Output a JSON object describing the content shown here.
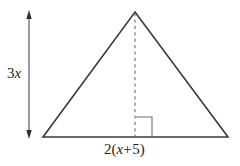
{
  "figure": {
    "name": "isosceles-triangle-with-height-and-base-labels",
    "background_color": "#ffffff",
    "stroke_color": "#3a3a3a",
    "text_color": "#231f20",
    "shape": {
      "type": "triangle",
      "apex": [
        135,
        12
      ],
      "left_vertex": [
        43,
        137
      ],
      "right_vertex": [
        228,
        137
      ]
    },
    "altitude": {
      "style": "dashed",
      "from": [
        135,
        12
      ],
      "to": [
        135,
        137
      ],
      "right_angle_marker": true
    },
    "height_dimension": {
      "style": "double-headed-arrow",
      "x": 29,
      "top_y": 12,
      "bottom_y": 137
    }
  },
  "labels": {
    "height": {
      "full_text": "3x",
      "coefficient": "3",
      "variable": "x"
    },
    "base": {
      "full_text": "2(x + 5)",
      "coefficient": "2",
      "open_paren": "(",
      "variable": "x",
      "operator": "+",
      "constant": "5",
      "close_paren": ")"
    }
  }
}
